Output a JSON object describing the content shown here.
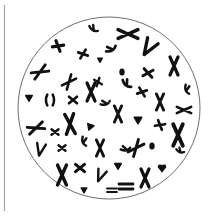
{
  "figure": {
    "colors": {
      "background": "#ffffff",
      "circle_stroke": "#6e6e6e",
      "chromosome": "#111111",
      "side_line": "#9a9a9a"
    },
    "circle": {
      "cx": 109,
      "cy": 108,
      "r": 91
    },
    "chromosomes": [
      {
        "x": 93,
        "y": 30,
        "type": "bent",
        "rot": 20,
        "s": 0.8
      },
      {
        "x": 128,
        "y": 34,
        "type": "xlong",
        "rot": 90,
        "s": 1.1
      },
      {
        "x": 58,
        "y": 46,
        "type": "cross",
        "rot": 30,
        "s": 0.9
      },
      {
        "x": 83,
        "y": 54,
        "type": "cross",
        "rot": -20,
        "s": 0.8
      },
      {
        "x": 112,
        "y": 50,
        "type": "bent",
        "rot": -40,
        "s": 0.9
      },
      {
        "x": 148,
        "y": 48,
        "type": "v",
        "rot": 30,
        "s": 1.1
      },
      {
        "x": 40,
        "y": 72,
        "type": "xlong",
        "rot": 60,
        "s": 0.9
      },
      {
        "x": 69,
        "y": 82,
        "type": "xlong",
        "rot": 40,
        "s": 0.8
      },
      {
        "x": 122,
        "y": 72,
        "type": "dot",
        "rot": 0,
        "s": 0.9
      },
      {
        "x": 148,
        "y": 73,
        "type": "cross",
        "rot": 10,
        "s": 0.9
      },
      {
        "x": 174,
        "y": 66,
        "type": "xlong",
        "rot": 0,
        "s": 1.0
      },
      {
        "x": 98,
        "y": 82,
        "type": "cross",
        "rot": 70,
        "s": 0.7
      },
      {
        "x": 126,
        "y": 85,
        "type": "bent",
        "rot": 30,
        "s": 0.9
      },
      {
        "x": 29,
        "y": 98,
        "type": "tri",
        "rot": 0,
        "s": 0.8
      },
      {
        "x": 50,
        "y": 100,
        "type": "paren",
        "rot": 0,
        "s": 0.9
      },
      {
        "x": 73,
        "y": 100,
        "type": "cross",
        "rot": 0,
        "s": 0.8
      },
      {
        "x": 91,
        "y": 92,
        "type": "xlong",
        "rot": 0,
        "s": 1.0
      },
      {
        "x": 106,
        "y": 104,
        "type": "bent",
        "rot": -30,
        "s": 0.8
      },
      {
        "x": 142,
        "y": 92,
        "type": "cross",
        "rot": 20,
        "s": 0.8
      },
      {
        "x": 160,
        "y": 102,
        "type": "xlong",
        "rot": 0,
        "s": 0.9
      },
      {
        "x": 186,
        "y": 90,
        "type": "bent",
        "rot": 60,
        "s": 0.8
      },
      {
        "x": 184,
        "y": 110,
        "type": "xlong",
        "rot": 90,
        "s": 0.8
      },
      {
        "x": 36,
        "y": 128,
        "type": "xlong",
        "rot": 70,
        "s": 0.9
      },
      {
        "x": 55,
        "y": 132,
        "type": "cross",
        "rot": 0,
        "s": 0.7
      },
      {
        "x": 70,
        "y": 124,
        "type": "xlong",
        "rot": -5,
        "s": 1.1
      },
      {
        "x": 90,
        "y": 127,
        "type": "tri",
        "rot": 20,
        "s": 0.8
      },
      {
        "x": 118,
        "y": 114,
        "type": "xlong",
        "rot": 0,
        "s": 0.9
      },
      {
        "x": 138,
        "y": 120,
        "type": "tri",
        "rot": 0,
        "s": 0.9
      },
      {
        "x": 178,
        "y": 135,
        "type": "xlong",
        "rot": 0,
        "s": 1.2
      },
      {
        "x": 40,
        "y": 150,
        "type": "v",
        "rot": 10,
        "s": 0.8
      },
      {
        "x": 62,
        "y": 148,
        "type": "cross",
        "rot": 0,
        "s": 0.7
      },
      {
        "x": 83,
        "y": 142,
        "type": "bent",
        "rot": 60,
        "s": 0.8
      },
      {
        "x": 100,
        "y": 148,
        "type": "xlong",
        "rot": 0,
        "s": 0.9
      },
      {
        "x": 126,
        "y": 150,
        "type": "bent",
        "rot": -20,
        "s": 0.8
      },
      {
        "x": 152,
        "y": 146,
        "type": "dot",
        "rot": 0,
        "s": 0.9
      },
      {
        "x": 136,
        "y": 148,
        "type": "xlong",
        "rot": 40,
        "s": 0.9
      },
      {
        "x": 62,
        "y": 175,
        "type": "xlong",
        "rot": 0,
        "s": 1.1
      },
      {
        "x": 80,
        "y": 168,
        "type": "cross",
        "rot": 0,
        "s": 0.9
      },
      {
        "x": 100,
        "y": 176,
        "type": "v",
        "rot": 20,
        "s": 0.8
      },
      {
        "x": 84,
        "y": 190,
        "type": "tri",
        "rot": 0,
        "s": 0.7
      },
      {
        "x": 118,
        "y": 166,
        "type": "tri",
        "rot": 0,
        "s": 0.8
      },
      {
        "x": 145,
        "y": 178,
        "type": "xlong",
        "rot": 0,
        "s": 1.0
      },
      {
        "x": 162,
        "y": 168,
        "type": "heart",
        "rot": 0,
        "s": 0.9
      },
      {
        "x": 126,
        "y": 186,
        "type": "eq",
        "rot": 0,
        "s": 1.0
      },
      {
        "x": 112,
        "y": 190,
        "type": "eq",
        "rot": 0,
        "s": 0.7
      },
      {
        "x": 100,
        "y": 60,
        "type": "tri",
        "rot": 0,
        "s": 0.6
      },
      {
        "x": 160,
        "y": 125,
        "type": "cross",
        "rot": 30,
        "s": 0.8
      },
      {
        "x": 180,
        "y": 152,
        "type": "bent",
        "rot": 10,
        "s": 0.7
      }
    ]
  }
}
